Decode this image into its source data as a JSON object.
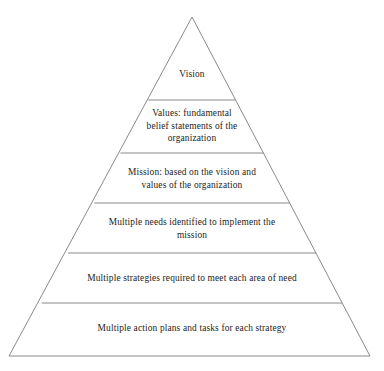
{
  "diagram": {
    "type": "pyramid",
    "background_color": "#ffffff",
    "stroke_color": "#8a8a8a",
    "text_color": "#242424",
    "apex": {
      "x": 192,
      "y": 17
    },
    "base_left": {
      "x": 9,
      "y": 356
    },
    "base_right": {
      "x": 370,
      "y": 356
    },
    "divider_y": [
      100,
      153,
      203,
      253,
      303
    ],
    "tiers": [
      {
        "index": 0,
        "name": "vision",
        "text": "Vision"
      },
      {
        "index": 1,
        "name": "values",
        "text": "Values: fundamental\nbelief statements of the\norganization"
      },
      {
        "index": 2,
        "name": "mission",
        "text": "Mission: based on the vision and\nvalues of the organization"
      },
      {
        "index": 3,
        "name": "needs",
        "text": "Multiple needs identified to implement the\nmission"
      },
      {
        "index": 4,
        "name": "strategies",
        "text": "Multiple strategies required to meet each area of need"
      },
      {
        "index": 5,
        "name": "action-plans",
        "text": "Multiple action plans and tasks for each strategy"
      }
    ]
  }
}
